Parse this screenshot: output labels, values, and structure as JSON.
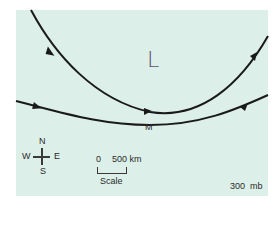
{
  "diagram": {
    "type": "upper-air-flow-map",
    "colors": {
      "background": "#dcefe9",
      "streamline": "#1a1a1a",
      "low_label": "#5a5070",
      "text": "#2b2b2b"
    },
    "low_pressure_label": "L",
    "point_label": "M",
    "pressure_level": "300  mb",
    "compass": {
      "north": "N",
      "south": "S",
      "west": "W",
      "east": "E"
    },
    "scale": {
      "start": "0",
      "end": "500 km",
      "title": "Scale"
    },
    "streamlines": [
      {
        "name": "upper-trough-streamline",
        "description": "U-shaped curve around low L, flowing from top-left down through M and up to top-right",
        "arrows": 3
      },
      {
        "name": "lower-streamline",
        "description": "Gently curved line from left to right below M",
        "arrows": 2
      }
    ]
  }
}
